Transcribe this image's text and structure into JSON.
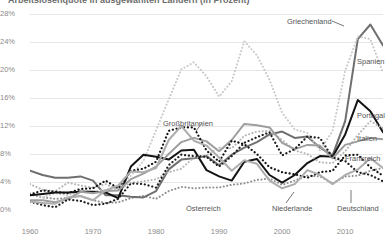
{
  "title": "Arbeitslosenquote in ausgewählten Ländern (in Prozent)",
  "chart_data": {
    "type": "line",
    "title": "Arbeitslosenquote in ausgewählten Ländern (in Prozent)",
    "xlabel": "",
    "ylabel": "",
    "xlim": [
      1960,
      2016
    ],
    "ylim": [
      0,
      28
    ],
    "grid": true,
    "legend_position": "inline-direct-labels",
    "y_ticks": [
      "0%",
      "4%",
      "8%",
      "12%",
      "16%",
      "20%",
      "24%",
      "28%"
    ],
    "y_tick_values": [
      0,
      4,
      8,
      12,
      16,
      20,
      24,
      28
    ],
    "x_ticks": [
      "1960",
      "1970",
      "1980",
      "1990",
      "2000",
      "2010"
    ],
    "x_tick_values": [
      1960,
      1970,
      1980,
      1990,
      2000,
      2010
    ],
    "x": [
      1960,
      1962,
      1964,
      1966,
      1968,
      1970,
      1972,
      1974,
      1976,
      1978,
      1980,
      1982,
      1984,
      1986,
      1988,
      1990,
      1992,
      1994,
      1996,
      1998,
      2000,
      2002,
      2004,
      2006,
      2008,
      2010,
      2012,
      2014,
      2016
    ],
    "series": [
      {
        "name": "Griechenland",
        "style": "solid",
        "color": "#6f6f6f",
        "width": 2.0,
        "label_x": 2004,
        "label_y": 27.4,
        "values": [
          5.6,
          5.0,
          4.6,
          4.6,
          4.8,
          4.2,
          2.1,
          2.1,
          1.9,
          1.8,
          2.7,
          5.8,
          7.2,
          7.4,
          7.7,
          6.4,
          7.9,
          8.9,
          9.7,
          10.8,
          11.2,
          10.3,
          10.5,
          8.9,
          7.8,
          12.7,
          24.4,
          26.5,
          23.5
        ]
      },
      {
        "name": "Spanien",
        "style": "dotted",
        "color": "#c8c8c8",
        "width": 2.0,
        "label_x": 2011,
        "label_y": 22.4,
        "values": [
          2.4,
          1.8,
          2.4,
          2.1,
          2.8,
          2.6,
          2.9,
          3.1,
          4.9,
          7.0,
          11.4,
          15.8,
          20.1,
          21.1,
          19.1,
          16.2,
          18.4,
          24.1,
          22.1,
          18.6,
          13.9,
          11.5,
          11.0,
          8.5,
          11.3,
          19.9,
          24.8,
          24.4,
          19.6
        ]
      },
      {
        "name": "Portugal",
        "style": "solid",
        "color": "#141414",
        "width": 2.0,
        "label_x": 2013,
        "label_y": 15.3,
        "values": [
          2.1,
          2.3,
          2.5,
          2.5,
          2.6,
          2.6,
          2.5,
          1.7,
          6.2,
          7.9,
          7.6,
          7.2,
          8.5,
          8.6,
          5.7,
          4.8,
          4.2,
          6.9,
          7.3,
          5.0,
          3.9,
          5.0,
          6.7,
          7.7,
          7.6,
          10.8,
          15.7,
          14.1,
          11.1
        ]
      },
      {
        "name": "Italien",
        "style": "dotted",
        "color": "#b4b4b4",
        "width": 2.0,
        "label_x": 2013,
        "label_y": 12.4,
        "values": [
          3.7,
          2.9,
          2.7,
          3.9,
          3.5,
          3.2,
          3.7,
          2.9,
          3.9,
          4.1,
          4.4,
          5.4,
          5.9,
          7.5,
          7.8,
          8.9,
          8.8,
          10.6,
          11.2,
          11.3,
          10.0,
          8.5,
          8.0,
          6.8,
          6.7,
          8.4,
          10.7,
          12.7,
          11.7
        ]
      },
      {
        "name": "Frankreich",
        "style": "solid",
        "color": "#9e9e9e",
        "width": 2.0,
        "label_x": 2013,
        "label_y": 9.6,
        "values": [
          1.4,
          1.4,
          1.1,
          1.6,
          2.6,
          2.4,
          2.7,
          2.8,
          4.4,
          5.2,
          6.2,
          8.0,
          9.7,
          10.3,
          9.8,
          8.4,
          10.0,
          12.3,
          12.1,
          11.8,
          9.6,
          8.7,
          9.3,
          9.2,
          7.4,
          9.3,
          9.8,
          10.3,
          10.1
        ]
      },
      {
        "name": "Großbritannien",
        "style": "dotted",
        "color": "#141414",
        "width": 2.2,
        "label_x": 1988,
        "label_y": 13.8,
        "values": [
          2.2,
          2.8,
          2.6,
          2.4,
          3.0,
          3.1,
          4.2,
          3.1,
          5.6,
          5.9,
          6.9,
          11.3,
          11.8,
          11.8,
          8.5,
          6.9,
          9.9,
          9.4,
          8.0,
          6.1,
          5.4,
          5.1,
          4.6,
          5.4,
          5.6,
          7.8,
          7.9,
          6.1,
          4.9
        ]
      },
      {
        "name": "Deutschland",
        "style": "dotted",
        "color": "#1e1e1e",
        "width": 2.2,
        "label_x": 2011,
        "label_y": 2.6,
        "values": [
          1.2,
          0.7,
          0.4,
          1.5,
          1.3,
          0.7,
          0.9,
          1.6,
          3.8,
          3.7,
          3.2,
          6.4,
          7.9,
          7.7,
          7.6,
          6.2,
          7.7,
          9.6,
          10.4,
          11.1,
          7.8,
          8.7,
          10.5,
          10.3,
          7.5,
          7.0,
          5.4,
          5.0,
          4.1
        ]
      },
      {
        "name": "Niederlande",
        "style": "solid",
        "color": "#adadad",
        "width": 2.0,
        "label_x": 1999,
        "label_y": 2.6,
        "values": [
          1.2,
          1.0,
          0.9,
          1.8,
          2.0,
          1.4,
          2.8,
          3.5,
          5.5,
          5.4,
          6.0,
          10.0,
          12.0,
          9.9,
          9.2,
          7.5,
          5.6,
          7.1,
          6.6,
          4.2,
          3.1,
          3.7,
          5.7,
          5.0,
          3.7,
          5.0,
          5.8,
          7.4,
          6.0
        ]
      }
    ]
  },
  "series_labels": {
    "griechenland": "Griechenland",
    "spanien": "Spanien",
    "portugal": "Portugal",
    "italien": "Italien",
    "frankreich": "Frankreich",
    "grossbritannien": "Großbritannien",
    "oesterreich": "Österreich",
    "deutschland": "Deutschland",
    "niederlande": "Niederlande"
  },
  "oesterreich": {
    "name": "Österreich",
    "style": "dotted",
    "color": "#8f8f8f",
    "width": 2.0,
    "values": [
      2.2,
      1.8,
      1.6,
      1.7,
      2.0,
      1.4,
      1.0,
      1.1,
      1.7,
      2.0,
      1.6,
      2.7,
      3.3,
      3.1,
      3.2,
      3.2,
      3.6,
      3.8,
      4.3,
      4.5,
      3.6,
      4.2,
      4.9,
      4.8,
      3.8,
      4.8,
      4.9,
      5.6,
      6.0
    ]
  },
  "y_axis_ticks": [
    {
      "label": "28%",
      "value": 28
    },
    {
      "label": "24%",
      "value": 24
    },
    {
      "label": "20%",
      "value": 20
    },
    {
      "label": "16%",
      "value": 16
    },
    {
      "label": "12%",
      "value": 12
    },
    {
      "label": "8%",
      "value": 8
    },
    {
      "label": "4%",
      "value": 4
    },
    {
      "label": "0%",
      "value": 0
    }
  ],
  "x_axis_ticks": [
    {
      "label": "1960",
      "value": 1960
    },
    {
      "label": "1970",
      "value": 1970
    },
    {
      "label": "1980",
      "value": 1980
    },
    {
      "label": "1990",
      "value": 1990
    },
    {
      "label": "2000",
      "value": 2000
    },
    {
      "label": "2010",
      "value": 2010
    }
  ]
}
